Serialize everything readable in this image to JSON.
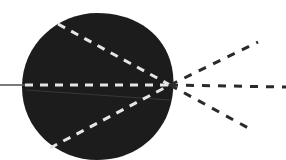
{
  "diagram": {
    "type": "optical-ray-diagram",
    "colors": {
      "background": "#ffffff",
      "body": "#1c1c1c",
      "rays_inside": "#e6e6e6",
      "rays_outside": "#2a2a2a",
      "axis_line": "#5a5a5a"
    },
    "body": {
      "shape": "sphere",
      "center": [
        97,
        87
      ],
      "rx": 75,
      "ry": 74
    },
    "focal_point": [
      170,
      85
    ],
    "incoming_rays": [
      {
        "name": "upper-ray",
        "from": [
          58,
          24
        ],
        "to": [
          170,
          85
        ]
      },
      {
        "name": "axis-ray",
        "from": [
          25,
          85
        ],
        "to": [
          170,
          85
        ]
      },
      {
        "name": "lower-ray",
        "from": [
          50,
          148
        ],
        "to": [
          170,
          85
        ]
      }
    ],
    "outgoing_rays": [
      {
        "name": "upper-diverging-ray",
        "from": [
          170,
          85
        ],
        "to": [
          258,
          42
        ]
      },
      {
        "name": "axis-diverging-ray",
        "from": [
          170,
          85
        ],
        "to": [
          286,
          87
        ]
      },
      {
        "name": "lower-diverging-ray",
        "from": [
          170,
          85
        ],
        "to": [
          250,
          129
        ]
      }
    ],
    "axis_line": {
      "from": [
        0,
        85
      ],
      "to": [
        25,
        85
      ]
    },
    "faint_line": {
      "from": [
        26,
        90
      ],
      "to": [
        170,
        100
      ]
    }
  }
}
